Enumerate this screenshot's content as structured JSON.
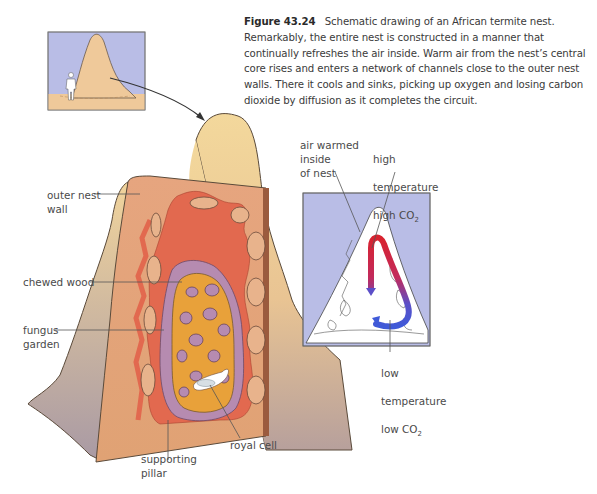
{
  "caption": {
    "figure_number": "Figure 43.24",
    "text": "Schematic drawing of an African termite nest. Remarkably, the entire nest is constructed in a manner that continually refreshes the air inside. Warm air from the nest’s central core rises and enters a network of channels close to the outer nest walls. There it cools and sinks, picking up oxygen and losing carbon dioxide by diffusion as it completes the circuit."
  },
  "labels": {
    "outer_nest_wall": "outer nest\nwall",
    "chewed_wood": "chewed wood",
    "fungus_garden": "fungus\ngarden",
    "supporting_pillar": "supporting\npillar",
    "royal_cell": "royal cell",
    "air_warmed": "air warmed\ninside\nof nest",
    "high_temp_line1": "high",
    "high_temp_line2": "temperature",
    "high_co2_prefix": "high ",
    "low_temp_line1": "low",
    "low_temp_line2": "temperature",
    "low_co2_prefix": "low ",
    "co2": "CO",
    "co2_sub": "2"
  },
  "colors": {
    "sky": "#b9bde6",
    "mound_light": "#f2d49a",
    "mound_shade": "#b7a39a",
    "cut_face": "#e9a77d",
    "channels": "#e2694f",
    "fungus_purple": "#b68bb0",
    "core_orange": "#e8a13a",
    "warm_air": "#d8232f",
    "cool_air": "#3f5ad8"
  }
}
